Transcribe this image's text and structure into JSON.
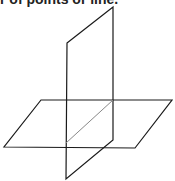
{
  "caption": {
    "text": "r of points or line."
  },
  "figure": {
    "stroke_color": "#1a1a1a",
    "intersection_color": "#888888",
    "horizontal_plane": [
      [
        41,
        100
      ],
      [
        172,
        100
      ],
      [
        135,
        148
      ],
      [
        4,
        147
      ]
    ],
    "vertical_plane": [
      [
        67,
        43
      ],
      [
        113,
        7
      ],
      [
        113,
        140
      ],
      [
        66,
        179
      ]
    ],
    "intersection_line": [
      [
        66,
        143
      ],
      [
        113,
        100
      ]
    ]
  }
}
